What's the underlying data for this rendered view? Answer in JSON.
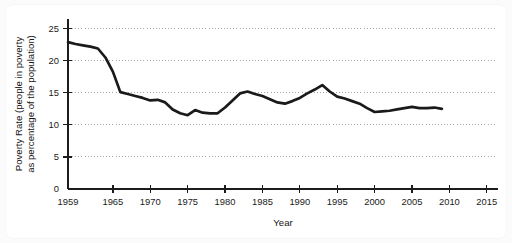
{
  "chart_data": {
    "type": "line",
    "title": "",
    "xlabel": "Year",
    "ylabel": "Poverty Rate (people in poverty as percentage of the population)",
    "ylabel_line1": "Poverty Rate (people in poverty",
    "ylabel_line2": "as percentage of the population)",
    "xlim": [
      1959,
      2016.5
    ],
    "ylim": [
      0,
      26.5
    ],
    "grid": "horizontal-dotted",
    "legend": "none",
    "series_color": "#1a1a1a",
    "xticks": [
      1959,
      1965,
      1970,
      1975,
      1980,
      1985,
      1990,
      1995,
      2000,
      2005,
      2010,
      2015
    ],
    "xtick_labels": [
      "1959",
      "1965",
      "1970",
      "1975",
      "1980",
      "1985",
      "1990",
      "1995",
      "2000",
      "2005",
      "2010",
      "2015"
    ],
    "yticks": [
      0,
      5,
      10,
      15,
      20,
      25
    ],
    "ytick_labels": [
      "0",
      "5",
      "10",
      "15",
      "20",
      "25"
    ],
    "series": [
      {
        "name": "Poverty Rate",
        "x": [
          1959,
          1960,
          1961,
          1962,
          1963,
          1964,
          1965,
          1966,
          1967,
          1968,
          1969,
          1970,
          1971,
          1972,
          1973,
          1974,
          1975,
          1976,
          1977,
          1978,
          1979,
          1980,
          1981,
          1982,
          1983,
          1984,
          1985,
          1986,
          1987,
          1988,
          1989,
          1990,
          1991,
          1992,
          1993,
          1994,
          1995,
          1996,
          1997,
          1998,
          1999,
          2000,
          2001,
          2002,
          2003,
          2004,
          2005,
          2006,
          2007,
          2008,
          2009
        ],
        "values": [
          22.9,
          22.6,
          22.4,
          22.2,
          21.9,
          20.5,
          18.3,
          15.1,
          14.8,
          14.5,
          14.2,
          13.8,
          13.9,
          13.5,
          12.4,
          11.8,
          11.5,
          12.3,
          11.9,
          11.8,
          11.8,
          12.7,
          13.8,
          14.9,
          15.2,
          14.8,
          14.5,
          14.0,
          13.5,
          13.3,
          13.7,
          14.2,
          14.9,
          15.5,
          16.2,
          15.2,
          14.4,
          14.1,
          13.7,
          13.3,
          12.6,
          12.0,
          12.1,
          12.2,
          12.4,
          12.6,
          12.8,
          12.6,
          12.6,
          12.7,
          12.5
        ]
      }
    ]
  }
}
